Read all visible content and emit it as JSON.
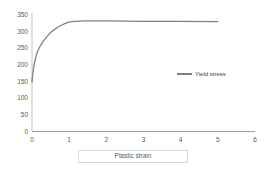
{
  "chart_data": {
    "type": "line",
    "title": "",
    "xlabel": "Plastic strain",
    "ylabel": "",
    "xlim": [
      0,
      6
    ],
    "ylim": [
      0,
      350
    ],
    "x_ticks": [
      0,
      1,
      2,
      3,
      4,
      5,
      6
    ],
    "y_ticks": [
      0,
      50,
      100,
      150,
      200,
      250,
      300,
      350
    ],
    "grid": false,
    "legend_position": "middle-right",
    "series": [
      {
        "name": "Yield stress",
        "color": "#808080",
        "x": [
          0,
          0.02,
          0.05,
          0.1,
          0.15,
          0.22,
          0.3,
          0.4,
          0.5,
          0.6,
          0.7,
          0.8,
          0.9,
          1.0,
          1.15,
          1.4,
          2.0,
          3.0,
          4.0,
          5.0
        ],
        "y": [
          148,
          172,
          196,
          222,
          240,
          256,
          270,
          284,
          296,
          305,
          313,
          319,
          324,
          328,
          330,
          331,
          331,
          330,
          329.5,
          329
        ]
      }
    ]
  },
  "colors": {
    "y_axis_line": "#bfbfbf",
    "x_axis_line": "#9e9e9e",
    "tick_label": "#595959",
    "legend_text": "#404040",
    "xlabel_box_border": "#d9d9d9"
  }
}
